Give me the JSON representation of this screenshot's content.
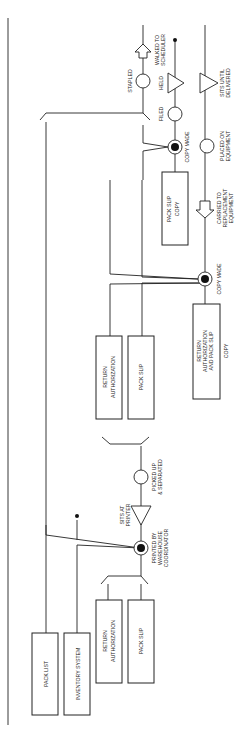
{
  "diagram": {
    "type": "process-flow-chart",
    "orientation": "rotated-90-ccw",
    "boxes": {
      "pack_list": "PACK LIST",
      "inventory_system": "INVENTORY SYSTEM",
      "return_auth_1": [
        "RETURN",
        "AUTHORIZATION"
      ],
      "pack_slip_1": "PACK SLIP",
      "return_auth_2": [
        "RETURN",
        "AUTHORIZATION"
      ],
      "pack_slip_2": "PACK SLIP",
      "ra_ps_copy": [
        "RETURN",
        "AUTHORIZATION",
        "AND PACK SLIP",
        "COPY"
      ],
      "pack_slip_copy": [
        "PACK SLIP",
        "COPY"
      ]
    },
    "steps": {
      "printed": [
        "PRINTED BY",
        "WAREHOUSE",
        "COORDINATOR"
      ],
      "sits_at_printer": [
        "SITS AT",
        "PRINTER"
      ],
      "picked_up": [
        "PICKED UP",
        "& SEPARATED"
      ],
      "copy_made_1": "COPY MADE",
      "carried": [
        "CARRIED TO",
        "REPLACEMENT",
        "EQUIPMENT"
      ],
      "placed": [
        "PLACED ON",
        "EQUIPMENT"
      ],
      "sits_until": [
        "SITS UNTIL",
        "DELIVERED"
      ],
      "copy_made_2": "COPY MADE",
      "filed": "FILED",
      "held": "HELD",
      "stapled": "STAPLED",
      "walked": [
        "WALKED TO",
        "SCHEDULER"
      ]
    }
  }
}
